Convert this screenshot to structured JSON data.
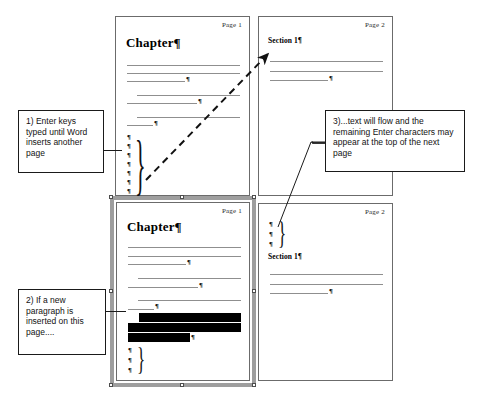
{
  "diagram": {
    "pages": [
      {
        "id": "top-left",
        "page_label": "Page 1",
        "heading": "Chapter¶",
        "heading_style": "large",
        "pilcrow_char": "¶",
        "brace_char": "}",
        "enter_marks_count": 7
      },
      {
        "id": "top-right",
        "page_label": "Page 2",
        "heading": "Section 1¶",
        "heading_style": "small",
        "pilcrow_char": "¶",
        "enter_marks_count": 0
      },
      {
        "id": "bottom-left",
        "page_label": "Page 1",
        "heading": "Chapter¶",
        "heading_style": "large",
        "pilcrow_char": "¶",
        "brace_char": "}",
        "enter_marks_count": 3,
        "selected": true,
        "highlighted_lines": 3
      },
      {
        "id": "bottom-right",
        "page_label": "Page 2",
        "heading": "Section 1¶",
        "heading_style": "small",
        "pilcrow_char": "¶",
        "brace_char": "}",
        "enter_marks_count": 3
      }
    ],
    "callouts": [
      {
        "id": "callout-1",
        "text": "1) Enter keys typed until Word inserts another page"
      },
      {
        "id": "callout-2",
        "text": "2) If a new paragraph is inserted on this page...."
      },
      {
        "id": "callout-3",
        "text": "3)...text will flow and the remaining Enter characters may appear at the top of the next page"
      }
    ],
    "annotations": {
      "flow_arrow": "dashed diagonal arrow from bottom of Page 1 to top of Page 2"
    },
    "colors": {
      "page_border": "#6b6b6b",
      "text_rule": "#8f8f8f",
      "callout_border": "#1a1a1a",
      "selection_frame": "#9e9e9e",
      "highlight": "#000000",
      "ink": "#121212"
    }
  }
}
